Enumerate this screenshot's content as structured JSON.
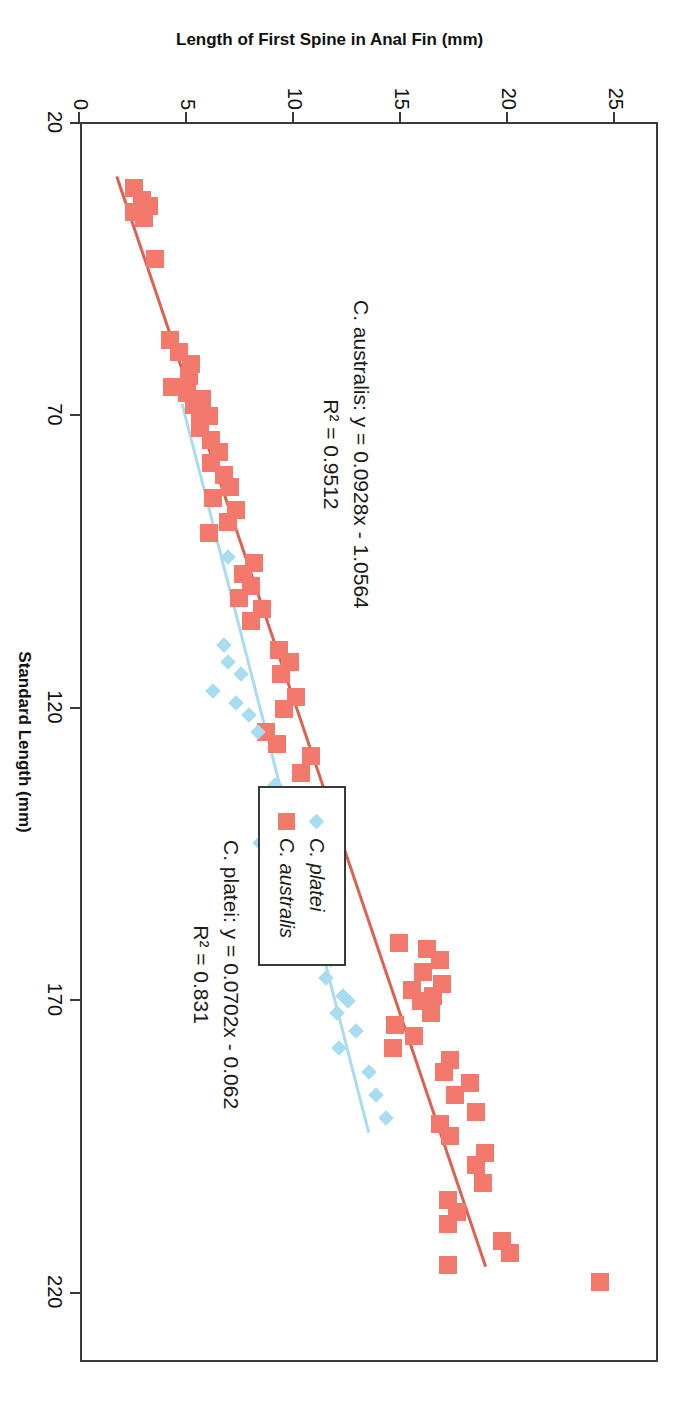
{
  "chart_data": {
    "type": "scatter",
    "title": "Callanthias",
    "xlabel": "Standard Length (mm)",
    "ylabel": "Length of First Spine in Anal Fin (mm)",
    "xlim": [
      20,
      232
    ],
    "ylim": [
      0,
      27
    ],
    "xticks": [
      20,
      70,
      120,
      170,
      220
    ],
    "yticks": [
      0,
      5,
      10,
      15,
      20,
      25
    ],
    "xtick_labels": [
      "20",
      "70",
      "120",
      "170",
      "220"
    ],
    "ytick_labels": [
      "0",
      "5",
      "10",
      "15",
      "20",
      "25"
    ],
    "grid": false,
    "legend_position": "lower right",
    "marker_colors": {
      "C. platei": "#a8dcf0",
      "C. australis": "#f2796c"
    },
    "trendline_colors": {
      "C. platei": "#a8dcf0",
      "C. australis": "#e06050"
    },
    "series": [
      {
        "name": "C. australis",
        "marker": "square",
        "color": "#f2796c",
        "points": [
          [
            31,
            2.6
          ],
          [
            33,
            3.0
          ],
          [
            34,
            3.3
          ],
          [
            35,
            2.6
          ],
          [
            36,
            3.1
          ],
          [
            43,
            3.6
          ],
          [
            57,
            4.3
          ],
          [
            59,
            4.7
          ],
          [
            61,
            5.3
          ],
          [
            63,
            5.2
          ],
          [
            65,
            4.4
          ],
          [
            66,
            5.1
          ],
          [
            67,
            5.8
          ],
          [
            68,
            5.4
          ],
          [
            69,
            5.7
          ],
          [
            70,
            6.1
          ],
          [
            72,
            5.7
          ],
          [
            74,
            6.2
          ],
          [
            76,
            6.6
          ],
          [
            78,
            6.2
          ],
          [
            80,
            6.8
          ],
          [
            82,
            7.1
          ],
          [
            84,
            6.3
          ],
          [
            86,
            7.4
          ],
          [
            88,
            7.0
          ],
          [
            90,
            6.1
          ],
          [
            95,
            8.2
          ],
          [
            97,
            7.7
          ],
          [
            99,
            8.1
          ],
          [
            101,
            7.5
          ],
          [
            103,
            8.6
          ],
          [
            105,
            8.1
          ],
          [
            110,
            9.4
          ],
          [
            112,
            9.9
          ],
          [
            114,
            9.5
          ],
          [
            118,
            10.2
          ],
          [
            120,
            9.6
          ],
          [
            124,
            8.8
          ],
          [
            126,
            9.3
          ],
          [
            128,
            10.9
          ],
          [
            131,
            10.4
          ],
          [
            135,
            11.5
          ],
          [
            137,
            11.1
          ],
          [
            160,
            15.0
          ],
          [
            161,
            16.3
          ],
          [
            163,
            16.9
          ],
          [
            165,
            16.1
          ],
          [
            167,
            17.0
          ],
          [
            168,
            15.6
          ],
          [
            169,
            16.6
          ],
          [
            170,
            16.0
          ],
          [
            172,
            16.5
          ],
          [
            174,
            14.8
          ],
          [
            176,
            15.7
          ],
          [
            178,
            14.7
          ],
          [
            180,
            17.4
          ],
          [
            182,
            17.1
          ],
          [
            184,
            18.3
          ],
          [
            186,
            17.6
          ],
          [
            189,
            18.6
          ],
          [
            191,
            16.9
          ],
          [
            193,
            17.4
          ],
          [
            196,
            19.0
          ],
          [
            198,
            18.6
          ],
          [
            201,
            18.9
          ],
          [
            204,
            17.3
          ],
          [
            206,
            17.7
          ],
          [
            208,
            17.3
          ],
          [
            211,
            19.8
          ],
          [
            213,
            20.2
          ],
          [
            215,
            17.3
          ],
          [
            218,
            24.4
          ]
        ]
      },
      {
        "name": "C. platei",
        "marker": "diamond",
        "color": "#a8dcf0",
        "points": [
          [
            94,
            7.0
          ],
          [
            109,
            6.8
          ],
          [
            112,
            7.0
          ],
          [
            114,
            7.6
          ],
          [
            117,
            6.3
          ],
          [
            119,
            7.4
          ],
          [
            121,
            8.0
          ],
          [
            124,
            8.4
          ],
          [
            133,
            9.2
          ],
          [
            143,
            8.5
          ],
          [
            160,
            11.1
          ],
          [
            163,
            11.8
          ],
          [
            166,
            11.6
          ],
          [
            169,
            12.4
          ],
          [
            170,
            12.6
          ],
          [
            172,
            12.1
          ],
          [
            175,
            13.0
          ],
          [
            178,
            12.2
          ],
          [
            182,
            13.6
          ],
          [
            186,
            13.9
          ],
          [
            190,
            14.4
          ]
        ]
      }
    ],
    "trendlines": [
      {
        "name": "C. australis",
        "slope": 0.0928,
        "intercept": -1.0564,
        "r2": 0.9512,
        "x_start": 29,
        "x_end": 216,
        "color": "#e06050",
        "label_line1": "C. australis: y = 0.0928x - 1.0564",
        "label_line2": "R² = 0.9512"
      },
      {
        "name": "C. platei",
        "slope": 0.0702,
        "intercept": -0.062,
        "r2": 0.831,
        "x_start": 68,
        "x_end": 193,
        "color": "#a8dcf0",
        "label_line1": "C. platei: y = 0.0702x - 0.062",
        "label_line2": "R² = 0.831"
      }
    ],
    "legend": [
      {
        "label": "C. platei",
        "marker": "diamond",
        "color": "#a8dcf0"
      },
      {
        "label": "C. australis",
        "marker": "square",
        "color": "#f2796c"
      }
    ]
  }
}
